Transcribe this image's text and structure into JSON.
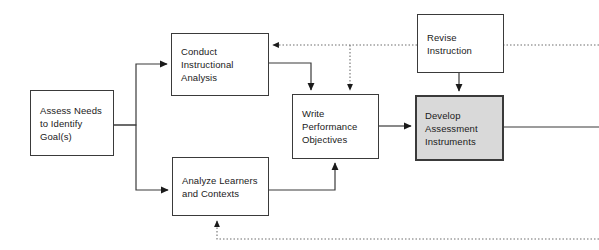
{
  "diagram": {
    "canvas": {
      "width": 599,
      "height": 250
    },
    "colors": {
      "stroke": "#3a3a3a",
      "text": "#1a1a1a",
      "node_fill": "#ffffff",
      "highlight_fill": "#d9d9d9",
      "dotted_stroke": "#7a7a7a"
    },
    "nodes": [
      {
        "id": "assess-needs",
        "label": "Assess Needs\nto Identify\nGoal(s)",
        "x": 30,
        "y": 90,
        "w": 84,
        "h": 66,
        "shaded": false
      },
      {
        "id": "conduct-instructional-analysis",
        "label": "Conduct\nInstructional\nAnalysis",
        "x": 171,
        "y": 33,
        "w": 98,
        "h": 63,
        "shaded": false
      },
      {
        "id": "analyze-learners-and-contexts",
        "label": "Analyze Learners\nand Contexts",
        "x": 172,
        "y": 157,
        "w": 97,
        "h": 59,
        "shaded": false
      },
      {
        "id": "write-performance-objectives",
        "label": "Write\nPerformance\nObjectives",
        "x": 292,
        "y": 94,
        "w": 87,
        "h": 65,
        "shaded": false
      },
      {
        "id": "develop-assessment-instruments",
        "label": "Develop\nAssessment\nInstruments",
        "x": 415,
        "y": 95,
        "w": 89,
        "h": 66,
        "shaded": true
      },
      {
        "id": "revise-instruction",
        "label": "Revise\nInstruction",
        "x": 417,
        "y": 14,
        "w": 87,
        "h": 59,
        "shaded": false
      }
    ],
    "connectors": [
      {
        "id": "assess-to-conduct",
        "from": "assess-needs",
        "to": "conduct-instructional-analysis",
        "style": "solid",
        "arrow": true
      },
      {
        "id": "assess-to-analyze",
        "from": "assess-needs",
        "to": "analyze-learners-and-contexts",
        "style": "solid",
        "arrow": true
      },
      {
        "id": "conduct-to-write",
        "from": "conduct-instructional-analysis",
        "to": "write-performance-objectives",
        "style": "solid",
        "arrow": true
      },
      {
        "id": "analyze-to-write",
        "from": "analyze-learners-and-contexts",
        "to": "write-performance-objectives",
        "style": "solid",
        "arrow": true
      },
      {
        "id": "write-to-develop",
        "from": "write-performance-objectives",
        "to": "develop-assessment-instruments",
        "style": "solid",
        "arrow": true
      },
      {
        "id": "revise-to-develop",
        "from": "revise-instruction",
        "to": "develop-assessment-instruments",
        "style": "solid",
        "arrow": true
      },
      {
        "id": "develop-to-right-edge",
        "from": "develop-assessment-instruments",
        "to": "off-canvas-right",
        "style": "solid",
        "arrow": false
      },
      {
        "id": "revise-feedback-to-conduct",
        "from": "revise-instruction",
        "to": "conduct-instructional-analysis",
        "style": "dotted",
        "arrow": true
      },
      {
        "id": "revise-feedback-to-write",
        "from": "revise-instruction",
        "to": "write-performance-objectives",
        "style": "dotted",
        "arrow": true
      },
      {
        "id": "revise-from-right-edge",
        "from": "off-canvas-right",
        "to": "revise-instruction",
        "style": "dotted",
        "arrow": false
      },
      {
        "id": "bottom-feedback-to-analyze",
        "from": "off-canvas-right-bottom",
        "to": "analyze-learners-and-contexts",
        "style": "dotted",
        "arrow": true
      }
    ]
  }
}
